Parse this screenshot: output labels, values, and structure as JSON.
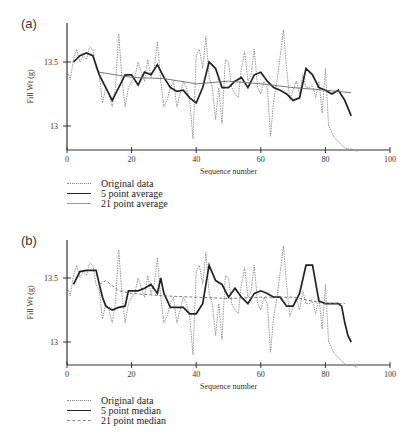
{
  "chart_data": [
    {
      "panel": "(a)",
      "type": "line",
      "xlabel": "Sequence number",
      "ylabel": "Fill Wt (g)",
      "xlim": [
        0,
        100
      ],
      "ylim": [
        12.82,
        13.8
      ],
      "xticks": [
        0,
        20,
        40,
        60,
        80,
        100
      ],
      "yticks": [
        13,
        13.5
      ],
      "ytick_labels": [
        "13",
        "13.5"
      ],
      "grid": false,
      "legend_position": "below",
      "series": [
        {
          "name": "Original data",
          "style": "dotted",
          "x": [
            0,
            1,
            2,
            3,
            4,
            5,
            6,
            7,
            8,
            9,
            10,
            11,
            12,
            13,
            14,
            15,
            16,
            17,
            18,
            19,
            20,
            21,
            22,
            23,
            24,
            25,
            26,
            27,
            28,
            29,
            30,
            31,
            32,
            33,
            34,
            35,
            36,
            37,
            38,
            39,
            40,
            41,
            42,
            43,
            44,
            45,
            46,
            47,
            48,
            49,
            50,
            51,
            52,
            53,
            54,
            55,
            56,
            57,
            58,
            59,
            60,
            61,
            62,
            63,
            64,
            65,
            66,
            67,
            68,
            69,
            70,
            71,
            72,
            73,
            74,
            75,
            76,
            77,
            78,
            79,
            80,
            81,
            82,
            83,
            84,
            85,
            86,
            87,
            88,
            89,
            90
          ],
          "values": [
            13.44,
            13.36,
            13.52,
            13.6,
            13.5,
            13.55,
            13.52,
            13.62,
            13.6,
            13.45,
            13.4,
            13.18,
            13.3,
            13.25,
            13.15,
            13.3,
            13.72,
            13.38,
            13.15,
            13.3,
            13.35,
            13.38,
            13.5,
            13.42,
            13.35,
            13.52,
            13.38,
            13.45,
            13.66,
            13.35,
            13.15,
            13.2,
            13.3,
            13.35,
            13.15,
            13.25,
            13.35,
            13.3,
            13.2,
            12.9,
            13.55,
            13.6,
            13.45,
            13.7,
            13.38,
            13.3,
            13.05,
            13.3,
            13.02,
            13.52,
            13.5,
            13.3,
            13.25,
            13.22,
            13.45,
            13.58,
            13.35,
            13.4,
            13.6,
            13.3,
            13.25,
            13.35,
            13.3,
            12.92,
            13.2,
            13.35,
            13.55,
            13.75,
            13.45,
            13.2,
            13.28,
            13.35,
            13.25,
            13.4,
            13.3,
            13.3,
            13.32,
            13.22,
            13.35,
            13.1,
            13.45,
            13.0,
            12.95,
            12.9,
            12.88,
            12.85,
            12.83,
            12.82,
            12.82,
            12.81,
            12.8
          ]
        },
        {
          "name": "5 point average",
          "style": "solid-bold",
          "x": [
            2,
            4,
            6,
            8,
            10,
            12,
            14,
            16,
            18,
            20,
            22,
            24,
            26,
            28,
            30,
            32,
            34,
            36,
            38,
            40,
            42,
            44,
            46,
            48,
            50,
            52,
            54,
            56,
            58,
            60,
            62,
            64,
            66,
            68,
            70,
            72,
            74,
            76,
            78,
            80,
            82,
            84,
            86,
            88
          ],
          "values": [
            13.5,
            13.55,
            13.57,
            13.55,
            13.4,
            13.3,
            13.2,
            13.3,
            13.4,
            13.4,
            13.32,
            13.42,
            13.4,
            13.48,
            13.38,
            13.3,
            13.27,
            13.28,
            13.22,
            13.18,
            13.3,
            13.5,
            13.45,
            13.3,
            13.3,
            13.35,
            13.38,
            13.3,
            13.4,
            13.42,
            13.35,
            13.3,
            13.28,
            13.25,
            13.2,
            13.22,
            13.45,
            13.4,
            13.3,
            13.28,
            13.25,
            13.28,
            13.2,
            13.08
          ]
        },
        {
          "name": "21 point average",
          "style": "thin-solid",
          "x": [
            10,
            20,
            30,
            40,
            50,
            60,
            70,
            80,
            88
          ],
          "values": [
            13.42,
            13.38,
            13.37,
            13.33,
            13.35,
            13.33,
            13.3,
            13.28,
            13.26
          ]
        }
      ]
    },
    {
      "panel": "(b)",
      "type": "line",
      "xlabel": "Sequence number",
      "ylabel": "Fill Wt (g)",
      "xlim": [
        0,
        100
      ],
      "ylim": [
        12.82,
        13.8
      ],
      "xticks": [
        0,
        20,
        40,
        60,
        80,
        100
      ],
      "yticks": [
        13,
        13.5
      ],
      "ytick_labels": [
        "13",
        "13.5"
      ],
      "grid": false,
      "legend_position": "below",
      "series": [
        {
          "name": "Original data",
          "style": "dotted",
          "x": [
            0,
            1,
            2,
            3,
            4,
            5,
            6,
            7,
            8,
            9,
            10,
            11,
            12,
            13,
            14,
            15,
            16,
            17,
            18,
            19,
            20,
            21,
            22,
            23,
            24,
            25,
            26,
            27,
            28,
            29,
            30,
            31,
            32,
            33,
            34,
            35,
            36,
            37,
            38,
            39,
            40,
            41,
            42,
            43,
            44,
            45,
            46,
            47,
            48,
            49,
            50,
            51,
            52,
            53,
            54,
            55,
            56,
            57,
            58,
            59,
            60,
            61,
            62,
            63,
            64,
            65,
            66,
            67,
            68,
            69,
            70,
            71,
            72,
            73,
            74,
            75,
            76,
            77,
            78,
            79,
            80,
            81,
            82,
            83,
            84,
            85,
            86,
            87,
            88,
            89,
            90
          ],
          "values": [
            13.44,
            13.36,
            13.52,
            13.6,
            13.5,
            13.55,
            13.52,
            13.62,
            13.6,
            13.45,
            13.4,
            13.18,
            13.3,
            13.25,
            13.15,
            13.3,
            13.72,
            13.38,
            13.15,
            13.3,
            13.35,
            13.38,
            13.5,
            13.42,
            13.35,
            13.52,
            13.38,
            13.45,
            13.66,
            13.35,
            13.15,
            13.2,
            13.3,
            13.35,
            13.15,
            13.25,
            13.35,
            13.3,
            13.2,
            12.9,
            13.55,
            13.6,
            13.45,
            13.7,
            13.38,
            13.3,
            13.05,
            13.3,
            13.02,
            13.52,
            13.5,
            13.3,
            13.25,
            13.22,
            13.45,
            13.58,
            13.35,
            13.4,
            13.6,
            13.3,
            13.25,
            13.35,
            13.3,
            12.92,
            13.2,
            13.35,
            13.55,
            13.75,
            13.45,
            13.2,
            13.28,
            13.35,
            13.25,
            13.4,
            13.3,
            13.3,
            13.32,
            13.22,
            13.35,
            13.1,
            13.45,
            13.0,
            12.95,
            12.9,
            12.88,
            12.85,
            12.83,
            12.82,
            12.82,
            12.81,
            12.8
          ]
        },
        {
          "name": "5 point median",
          "style": "solid-bold",
          "x": [
            2,
            4,
            6,
            8,
            9,
            10,
            11,
            12,
            14,
            16,
            18,
            19,
            20,
            22,
            24,
            26,
            28,
            29,
            30,
            32,
            34,
            36,
            38,
            40,
            42,
            44,
            46,
            48,
            50,
            52,
            54,
            56,
            58,
            60,
            62,
            64,
            66,
            68,
            70,
            72,
            74,
            76,
            78,
            80,
            82,
            84,
            85,
            86,
            87,
            88
          ],
          "values": [
            13.45,
            13.55,
            13.56,
            13.56,
            13.56,
            13.45,
            13.35,
            13.28,
            13.25,
            13.27,
            13.28,
            13.4,
            13.4,
            13.4,
            13.42,
            13.45,
            13.38,
            13.5,
            13.38,
            13.27,
            13.27,
            13.27,
            13.22,
            13.22,
            13.3,
            13.6,
            13.48,
            13.45,
            13.35,
            13.42,
            13.35,
            13.3,
            13.38,
            13.4,
            13.38,
            13.35,
            13.35,
            13.28,
            13.28,
            13.38,
            13.6,
            13.6,
            13.32,
            13.3,
            13.3,
            13.3,
            13.28,
            13.15,
            13.05,
            13.0
          ]
        },
        {
          "name": "21 point median",
          "style": "dashed",
          "x": [
            10,
            12,
            16,
            20,
            30,
            40,
            50,
            60,
            70,
            80,
            86
          ],
          "values": [
            13.45,
            13.48,
            13.4,
            13.38,
            13.36,
            13.35,
            13.34,
            13.35,
            13.35,
            13.3,
            13.3
          ]
        }
      ]
    }
  ],
  "panels": {
    "a": {
      "label": "(a)",
      "xlabel": "Sequence number",
      "ylabel": "Fill Wt (g)",
      "legend": [
        "Original data",
        "5 point average",
        "21 point average"
      ]
    },
    "b": {
      "label": "(b)",
      "xlabel": "Sequence number",
      "ylabel": "Fill Wt (g)",
      "legend": [
        "Original data",
        "5 point median",
        "21 point median"
      ]
    }
  },
  "xtick_labels": [
    "0",
    "20",
    "40",
    "60",
    "80",
    "100"
  ],
  "ytick_labels": [
    "13",
    "13.5"
  ],
  "colors": {
    "axis": "#333333",
    "original": "#8a8a8a",
    "smooth5": "#222222",
    "smooth21": "#6a6a6a"
  }
}
